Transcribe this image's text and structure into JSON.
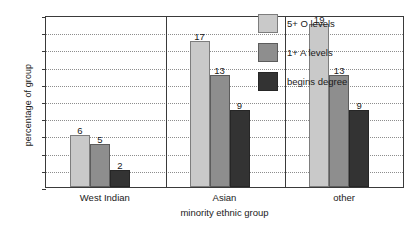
{
  "chart_data": {
    "type": "bar",
    "title": "",
    "subtitle": "",
    "xlabel": "minority ethnic group",
    "ylabel": "percentage of group",
    "categories": [
      "West Indian",
      "Asian",
      "other"
    ],
    "series": [
      {
        "name": "5+ O levels",
        "color": "#c9c9c9",
        "values": [
          6,
          17,
          19
        ]
      },
      {
        "name": "1+ A levels",
        "color": "#8e8e8e",
        "values": [
          5,
          13,
          13
        ]
      },
      {
        "name": "begins degree",
        "color": "#333333",
        "values": [
          2,
          9,
          9
        ]
      }
    ],
    "ylim": [
      0,
      20
    ],
    "ytick_values": [
      0,
      2,
      4,
      6,
      8,
      10,
      12,
      14,
      16,
      18,
      20
    ],
    "ytick_labels": [
      "0",
      "2",
      "4",
      "6",
      "8",
      "10",
      "12",
      "14",
      "16",
      "18",
      "20"
    ],
    "grid": true,
    "grid_style": "dotted-horizontal",
    "legend_position": "inside-top-right",
    "data_labels": true,
    "data_label_values": [
      [
        "6",
        "5",
        "2"
      ],
      [
        "17",
        "13",
        "9"
      ],
      [
        "19",
        "13",
        "9"
      ]
    ],
    "group_separators": true,
    "frame": true
  }
}
